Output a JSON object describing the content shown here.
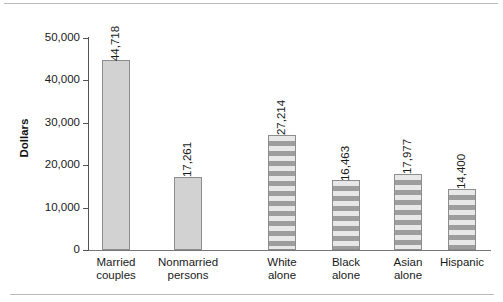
{
  "chart_data": {
    "type": "bar",
    "title": "",
    "subtitle": "",
    "xlabel": "",
    "ylabel": "Dollars",
    "ylim": [
      0,
      50000
    ],
    "ytick_labels": [
      "0",
      "10,000",
      "20,000",
      "30,000",
      "40,000",
      "50,000"
    ],
    "ytick_values": [
      0,
      10000,
      20000,
      30000,
      40000,
      50000
    ],
    "grid": false,
    "legend": "none",
    "groups": [
      {
        "name": "household-type",
        "fill": "solid"
      },
      {
        "name": "race-ethnicity",
        "fill": "striped"
      }
    ],
    "categories": [
      "Married couples",
      "Nonmarried persons",
      "White alone",
      "Black alone",
      "Asian alone",
      "Hispanic"
    ],
    "values": [
      44718,
      17261,
      27214,
      16463,
      17977,
      14400
    ],
    "value_labels": [
      "44,718",
      "17,261",
      "27,214",
      "16,463",
      "17,977",
      "14,400"
    ],
    "bars": [
      {
        "category": "Married couples",
        "label_line1": "Married",
        "label_line2": "couples",
        "value": 44718,
        "value_label": "44,718",
        "fill": "solid"
      },
      {
        "category": "Nonmarried persons",
        "label_line1": "Nonmarried",
        "label_line2": "persons",
        "value": 17261,
        "value_label": "17,261",
        "fill": "solid"
      },
      {
        "category": "White alone",
        "label_line1": "White",
        "label_line2": "alone",
        "value": 27214,
        "value_label": "27,214",
        "fill": "striped"
      },
      {
        "category": "Black alone",
        "label_line1": "Black",
        "label_line2": "alone",
        "value": 16463,
        "value_label": "16,463",
        "fill": "striped"
      },
      {
        "category": "Asian alone",
        "label_line1": "Asian",
        "label_line2": "alone",
        "value": 17977,
        "value_label": "17,977",
        "fill": "striped"
      },
      {
        "category": "Hispanic",
        "label_line1": "Hispanic",
        "label_line2": "",
        "value": 14400,
        "value_label": "14,400",
        "fill": "striped"
      }
    ],
    "colors": {
      "bar_solid_fill": "#d2d2d2",
      "bar_stripe_light": "#e8e8e8",
      "bar_stripe_dark": "#9d9d9d",
      "bar_border": "#8d8d8d",
      "axis": "#555555",
      "text": "#1a1a1a",
      "rule": "#b9b9b9",
      "background": "#ffffff"
    }
  }
}
